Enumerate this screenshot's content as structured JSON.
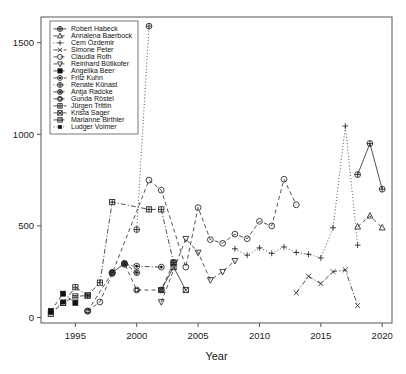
{
  "chart_data": {
    "type": "line",
    "title": "",
    "xlabel": "Year",
    "ylabel": "",
    "xlim": [
      1992.2,
      2020.8
    ],
    "ylim": [
      -30,
      1640
    ],
    "xticks": [
      1995,
      2000,
      2005,
      2010,
      2015,
      2020
    ],
    "xtick_labels": [
      "1995",
      "2000",
      "2005",
      "2010",
      "2015",
      "2020"
    ],
    "yticks": [
      0,
      500,
      1000,
      1500
    ],
    "ytick_labels": [
      "0",
      "500",
      "1000",
      "1500"
    ],
    "grid": false,
    "legend_position": "top-left",
    "series": [
      {
        "name": "Robert Habeck",
        "marker": "circle-plus",
        "linestyle": "solid",
        "x": [
          2018,
          2019,
          2020
        ],
        "y": [
          780,
          950,
          700
        ]
      },
      {
        "name": "Annalena Baerbock",
        "marker": "triangle-up",
        "linestyle": "dashed",
        "x": [
          2018,
          2019,
          2020
        ],
        "y": [
          495,
          555,
          490
        ]
      },
      {
        "name": "Cem Özdemir",
        "marker": "plus",
        "linestyle": "dotted",
        "x": [
          2008,
          2009,
          2010,
          2011,
          2012,
          2013,
          2014,
          2015,
          2016,
          2017,
          2018
        ],
        "y": [
          375,
          340,
          380,
          350,
          385,
          355,
          345,
          325,
          490,
          1045,
          395
        ]
      },
      {
        "name": "Simone Peter",
        "marker": "cross",
        "linestyle": "dash-dot",
        "x": [
          2013,
          2014,
          2015,
          2016,
          2017,
          2018
        ],
        "y": [
          135,
          225,
          185,
          250,
          260,
          65
        ]
      },
      {
        "name": "Claudia Roth",
        "marker": "circle",
        "linestyle": "dashed",
        "x": [
          1996,
          1997,
          1998,
          2001,
          2002,
          2004,
          2005,
          2006,
          2007,
          2008,
          2009,
          2010,
          2011,
          2012,
          2013
        ],
        "y": [
          35,
          85,
          240,
          750,
          695,
          275,
          600,
          425,
          405,
          455,
          430,
          525,
          500,
          755,
          615
        ]
      },
      {
        "name": "Reinhard Bütikofer",
        "marker": "triangle-down",
        "linestyle": "dashed",
        "x": [
          2002,
          2004,
          2005,
          2006,
          2007,
          2008
        ],
        "y": [
          85,
          430,
          355,
          205,
          250,
          310
        ]
      },
      {
        "name": "Angelika Beer",
        "marker": "square-filled",
        "linestyle": "dashed",
        "x": [
          1993,
          1994,
          1995
        ],
        "y": [
          35,
          130,
          80
        ]
      },
      {
        "name": "Fritz Kuhn",
        "marker": "circle-dot",
        "linestyle": "dash-dot",
        "x": [
          1999,
          2000,
          2002
        ],
        "y": [
          290,
          280,
          275
        ]
      },
      {
        "name": "Renate Künast",
        "marker": "circle-plus",
        "linestyle": "dotted",
        "x": [
          2000,
          2001
        ],
        "y": [
          480,
          1590
        ]
      },
      {
        "name": "Antja Radcke",
        "marker": "circle-star",
        "linestyle": "dashed",
        "x": [
          1998,
          1999,
          2000
        ],
        "y": [
          245,
          295,
          245
        ]
      },
      {
        "name": "Gunda Röstel",
        "marker": "circle-square",
        "linestyle": "dashed",
        "x": [
          1996,
          1998,
          1999,
          2000,
          2002,
          2003
        ],
        "y": [
          35,
          245,
          295,
          150,
          150,
          300
        ]
      },
      {
        "name": "Jürgen Trittin",
        "marker": "square-grid",
        "linestyle": "dash-dot",
        "x": [
          1994,
          1995,
          1996,
          1997,
          1998,
          2001,
          2002,
          2003
        ],
        "y": [
          80,
          165,
          120,
          190,
          630,
          590,
          590,
          300
        ]
      },
      {
        "name": "Krista Sager",
        "marker": "square-cross",
        "linestyle": "solid",
        "x": [
          2002,
          2003,
          2004
        ],
        "y": [
          150,
          275,
          150
        ]
      },
      {
        "name": "Marianne Birthler",
        "marker": "square-hatch",
        "linestyle": "dashed",
        "x": [
          1993,
          1994,
          1995,
          1996
        ],
        "y": [
          20,
          80,
          115,
          120
        ]
      },
      {
        "name": "Ludger Volmer",
        "marker": "square-small-filled",
        "linestyle": "dotted",
        "x": [
          1993,
          1994
        ],
        "y": [
          28,
          85
        ]
      }
    ]
  },
  "legend": {
    "entries": [
      "Robert Habeck",
      "Annalena Baerbock",
      "Cem Özdemir",
      "Simone Peter",
      "Claudia Roth",
      "Reinhard Bütikofer",
      "Angelika Beer",
      "Fritz Kuhn",
      "Renate Künast",
      "Antja Radcke",
      "Gunda Röstel",
      "Jürgen Trittin",
      "Krista Sager",
      "Marianne Birthler",
      "Ludger Volmer"
    ]
  },
  "colors": {
    "axis": "#555555",
    "line": "#333333",
    "marker": "#222222",
    "background": "#ffffff"
  }
}
